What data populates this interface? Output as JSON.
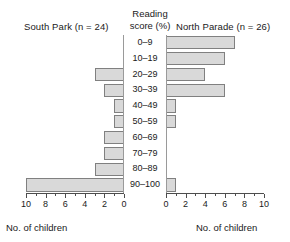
{
  "header": {
    "left_title": "South Park (n = 24)",
    "center_title_line1": "Reading",
    "center_title_line2": "score (%)",
    "right_title": "North Parade (n = 26)"
  },
  "axis": {
    "left_caption": "No. of children",
    "right_caption": "No. of children",
    "left_ticklabels": [
      "10",
      "8",
      "6",
      "4",
      "2",
      "0"
    ],
    "right_ticklabels": [
      "0",
      "2",
      "4",
      "6",
      "8",
      "10"
    ]
  },
  "chart_data": {
    "type": "bar",
    "orientation": "horizontal",
    "layout": "population-pyramid",
    "title": "",
    "categories": [
      "0–9",
      "10–19",
      "20–29",
      "30–39",
      "40–49",
      "50–59",
      "60–69",
      "70–79",
      "80–89",
      "90–100"
    ],
    "xlabel": "No. of children",
    "ylabel": "Reading score (%)",
    "xlim": [
      0,
      10
    ],
    "grid": false,
    "legend": "none",
    "series": [
      {
        "name": "South Park (n = 24)",
        "side": "left",
        "n": 24,
        "values": [
          0,
          0,
          3,
          2,
          1,
          1,
          2,
          2,
          3,
          10
        ]
      },
      {
        "name": "North Parade (n = 26)",
        "side": "right",
        "n": 26,
        "values": [
          7,
          6,
          4,
          6,
          1,
          1,
          0,
          0,
          0,
          1
        ]
      }
    ],
    "colors": {
      "bar_fill": "#d9d9d9",
      "bar_border": "#808080",
      "axis": "#4d4d4d",
      "text": "#1a1a1a"
    }
  }
}
